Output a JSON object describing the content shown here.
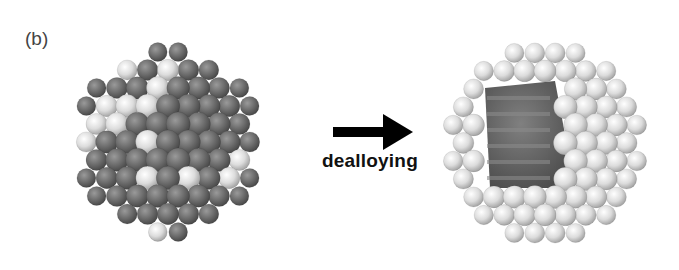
{
  "figure": {
    "panel_label": "(b)",
    "arrow_caption": "dealloying",
    "left_particle": {
      "description": "alloy nanoparticle before dealloying",
      "center": [
        168,
        142
      ],
      "radius": 95,
      "dark_color": "#6e6e6e",
      "light_color": "#e6e6e6"
    },
    "right_particle": {
      "description": "porous shell after dealloying with cut-away interior",
      "center": [
        545,
        143
      ],
      "radius": 103,
      "shell_color": "#e2e2e2",
      "interior_color": "#5a5a5a"
    },
    "arrow_color": "#000000"
  }
}
